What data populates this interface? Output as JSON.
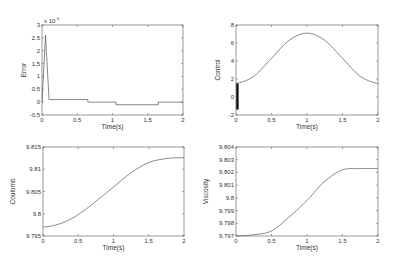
{
  "chart_data": [
    {
      "type": "line",
      "title": "",
      "xlabel": "Time(s)",
      "ylabel": "Error",
      "multiplier": "x 10^-3",
      "xlim": [
        0,
        2
      ],
      "ylim": [
        -0.5,
        3
      ],
      "xticks": [
        "0",
        "0.5",
        "1",
        "1.5",
        "2"
      ],
      "yticks": [
        "-0.5",
        "0",
        "0.5",
        "1",
        "1.5",
        "2",
        "2.5",
        "3"
      ],
      "series": [
        {
          "name": "Error",
          "x": [
            0,
            0.05,
            0.1,
            0.65,
            0.65,
            1.05,
            1.05,
            1.65,
            1.65,
            2.0
          ],
          "y": [
            0,
            2.6,
            0.1,
            0.1,
            0.0,
            0.0,
            -0.1,
            -0.1,
            0.0,
            0.0
          ]
        }
      ]
    },
    {
      "type": "line",
      "title": "",
      "xlabel": "Time(s)",
      "ylabel": "Control",
      "xlim": [
        0,
        2
      ],
      "ylim": [
        -2,
        8
      ],
      "xticks": [
        "0",
        "0.5",
        "1",
        "1.5",
        "2"
      ],
      "yticks": [
        "-2",
        "0",
        "2",
        "4",
        "6",
        "8"
      ],
      "annotations": [
        "dense chattering band near t=0 from about -1.4 to 1.5"
      ],
      "series": [
        {
          "name": "Control",
          "x": [
            0,
            0.25,
            0.5,
            0.75,
            1.0,
            1.25,
            1.5,
            1.75,
            2.0
          ],
          "y": [
            1.5,
            2.3,
            4.3,
            6.3,
            7.1,
            6.3,
            4.3,
            2.3,
            1.5
          ]
        }
      ],
      "chatter": {
        "x": 0.02,
        "ymin": -1.4,
        "ymax": 1.5
      }
    },
    {
      "type": "line",
      "title": "",
      "xlabel": "Time(s)",
      "ylabel": "Coulomb",
      "xlim": [
        0,
        2
      ],
      "ylim": [
        9.795,
        9.815
      ],
      "xticks": [
        "0",
        "0.5",
        "1",
        "1.5",
        "2"
      ],
      "yticks": [
        "9.795",
        "9.8",
        "9.805",
        "9.81",
        "9.815"
      ],
      "series": [
        {
          "name": "Coulomb",
          "x": [
            0,
            0.25,
            0.5,
            0.75,
            1.0,
            1.25,
            1.5,
            1.75,
            2.0
          ],
          "y": [
            9.797,
            9.7978,
            9.7998,
            9.8028,
            9.806,
            9.8092,
            9.8115,
            9.8124,
            9.8126
          ]
        }
      ]
    },
    {
      "type": "line",
      "title": "",
      "xlabel": "Time(s)",
      "ylabel": "Viscosity",
      "xlim": [
        0,
        2
      ],
      "ylim": [
        9.797,
        9.804
      ],
      "xticks": [
        "0",
        "0.5",
        "1",
        "1.5",
        "2"
      ],
      "yticks": [
        "9.797",
        "9.798",
        "9.799",
        "9.8",
        "9.801",
        "9.802",
        "9.803",
        "9.804"
      ],
      "series": [
        {
          "name": "Viscosity",
          "x": [
            0,
            0.25,
            0.5,
            0.75,
            1.0,
            1.25,
            1.5,
            1.75,
            2.0
          ],
          "y": [
            9.797,
            9.7971,
            9.7974,
            9.7985,
            9.7998,
            9.8013,
            9.8022,
            9.8023,
            9.8023
          ]
        }
      ]
    }
  ],
  "layout": {
    "panels": [
      {
        "x0": 42,
        "x1": 183,
        "y0": 25,
        "y1": 115
      },
      {
        "x0": 236,
        "x1": 378,
        "y0": 25,
        "y1": 115
      },
      {
        "x0": 43,
        "x1": 184,
        "y0": 147,
        "y1": 236
      },
      {
        "x0": 236,
        "x1": 378,
        "y0": 147,
        "y1": 236
      }
    ],
    "line_color": "#555555",
    "axis_color": "#555555"
  }
}
